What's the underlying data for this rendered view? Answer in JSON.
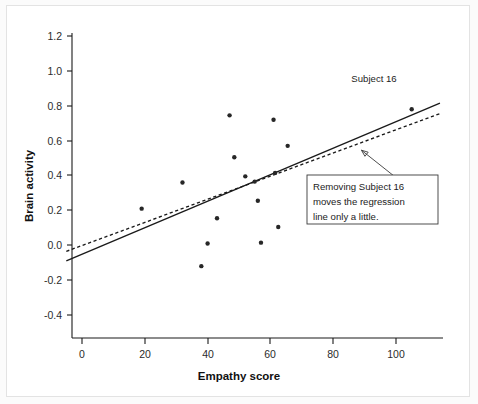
{
  "chart_data": {
    "type": "scatter",
    "title": "",
    "xlabel": "Empathy score",
    "ylabel": "Brain activity",
    "xlim": [
      -5,
      114
    ],
    "ylim": [
      -0.52,
      1.3
    ],
    "xticks": [
      0,
      20,
      40,
      60,
      80,
      100
    ],
    "xtick_labels": [
      "0",
      "20",
      "40",
      "60",
      "80",
      "100"
    ],
    "yticks": [
      -0.4,
      -0.2,
      0.0,
      0.2,
      0.4,
      0.6,
      0.8,
      1.0,
      1.2
    ],
    "ytick_labels": [
      "-0.4",
      "-0.2",
      "0.0",
      "0.2",
      "0.4",
      "0.6",
      "0.8",
      "1.0",
      "1.2"
    ],
    "grid": false,
    "legend": "none",
    "points": [
      {
        "x": 19,
        "y": 0.21
      },
      {
        "x": 32,
        "y": 0.36
      },
      {
        "x": 38,
        "y": -0.12
      },
      {
        "x": 40,
        "y": 0.01
      },
      {
        "x": 43,
        "y": 0.155
      },
      {
        "x": 47,
        "y": 0.745
      },
      {
        "x": 48.5,
        "y": 0.505
      },
      {
        "x": 52,
        "y": 0.395
      },
      {
        "x": 55,
        "y": 0.365
      },
      {
        "x": 56,
        "y": 0.255
      },
      {
        "x": 57,
        "y": 0.015
      },
      {
        "x": 61,
        "y": 0.72
      },
      {
        "x": 61.5,
        "y": 0.415
      },
      {
        "x": 62.5,
        "y": 0.105
      },
      {
        "x": 65.5,
        "y": 0.57
      },
      {
        "x": 105,
        "y": 0.78
      }
    ],
    "series": [
      {
        "name": "regression-all-subjects",
        "style": "solid",
        "x": [
          -5,
          114
        ],
        "y": [
          -0.09,
          0.815
        ]
      },
      {
        "name": "regression-without-subject-16",
        "style": "dashed",
        "x": [
          -5,
          114
        ],
        "y": [
          -0.035,
          0.755
        ]
      }
    ],
    "annotations": [
      {
        "name": "subject-16-label",
        "text": "Subject 16",
        "x": 93,
        "y": 0.935
      },
      {
        "name": "callout-box",
        "lines": [
          "Removing Subject 16",
          "moves the regression",
          "line only a little."
        ],
        "arrow_from_x": 103,
        "arrow_from_y": 0.345,
        "arrow_to_x": 89,
        "arrow_to_y": 0.545
      }
    ]
  }
}
